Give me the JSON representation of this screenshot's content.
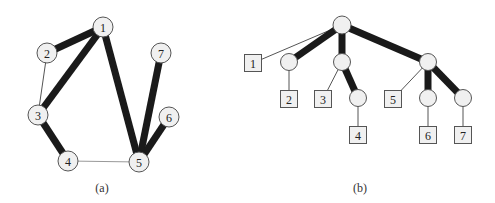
{
  "figure_a": {
    "caption": "(a)",
    "nodes": [
      {
        "id": "1",
        "label": "1",
        "x": 103,
        "y": 27
      },
      {
        "id": "2",
        "label": "2",
        "x": 47,
        "y": 53
      },
      {
        "id": "3",
        "label": "3",
        "x": 38,
        "y": 115
      },
      {
        "id": "4",
        "label": "4",
        "x": 68,
        "y": 161
      },
      {
        "id": "5",
        "label": "5",
        "x": 139,
        "y": 162
      },
      {
        "id": "6",
        "label": "6",
        "x": 169,
        "y": 117
      },
      {
        "id": "7",
        "label": "7",
        "x": 161,
        "y": 53
      }
    ],
    "edges": [
      {
        "from": "1",
        "to": "2",
        "weight": "heavy"
      },
      {
        "from": "1",
        "to": "3",
        "weight": "heavy"
      },
      {
        "from": "1",
        "to": "5",
        "weight": "heavy"
      },
      {
        "from": "2",
        "to": "3",
        "weight": "thin"
      },
      {
        "from": "3",
        "to": "4",
        "weight": "heavy"
      },
      {
        "from": "4",
        "to": "5",
        "weight": "light"
      },
      {
        "from": "5",
        "to": "7",
        "weight": "heavy"
      },
      {
        "from": "5",
        "to": "6",
        "weight": "heavy"
      }
    ]
  },
  "figure_b": {
    "caption": "(b)",
    "internal_nodes": [
      {
        "id": "root",
        "x": 342,
        "y": 25
      },
      {
        "id": "n2",
        "x": 289,
        "y": 62
      },
      {
        "id": "n34",
        "x": 342,
        "y": 62
      },
      {
        "id": "n4",
        "x": 358,
        "y": 98
      },
      {
        "id": "n567",
        "x": 428,
        "y": 62
      },
      {
        "id": "n6",
        "x": 428,
        "y": 98
      },
      {
        "id": "n7",
        "x": 463,
        "y": 98
      }
    ],
    "leaves": [
      {
        "id": "l1",
        "label": "1",
        "x": 253,
        "y": 63
      },
      {
        "id": "l2",
        "label": "2",
        "x": 289,
        "y": 99
      },
      {
        "id": "l3",
        "label": "3",
        "x": 323,
        "y": 99
      },
      {
        "id": "l4",
        "label": "4",
        "x": 358,
        "y": 135
      },
      {
        "id": "l5",
        "label": "5",
        "x": 393,
        "y": 99
      },
      {
        "id": "l6",
        "label": "6",
        "x": 428,
        "y": 135
      },
      {
        "id": "l7",
        "label": "7",
        "x": 463,
        "y": 135
      }
    ],
    "edges": [
      {
        "from": "root",
        "to": "l1",
        "weight": "thin"
      },
      {
        "from": "root",
        "to": "n2",
        "weight": "heavy"
      },
      {
        "from": "root",
        "to": "n34",
        "weight": "heavy"
      },
      {
        "from": "root",
        "to": "n567",
        "weight": "heavy"
      },
      {
        "from": "n2",
        "to": "l2",
        "weight": "thin"
      },
      {
        "from": "n34",
        "to": "l3",
        "weight": "thin"
      },
      {
        "from": "n34",
        "to": "n4",
        "weight": "heavy"
      },
      {
        "from": "n4",
        "to": "l4",
        "weight": "thin"
      },
      {
        "from": "n567",
        "to": "l5",
        "weight": "thin"
      },
      {
        "from": "n567",
        "to": "n6",
        "weight": "heavy"
      },
      {
        "from": "n567",
        "to": "n7",
        "weight": "heavy"
      },
      {
        "from": "n6",
        "to": "l6",
        "weight": "thin"
      },
      {
        "from": "n7",
        "to": "l7",
        "weight": "thin"
      }
    ]
  }
}
